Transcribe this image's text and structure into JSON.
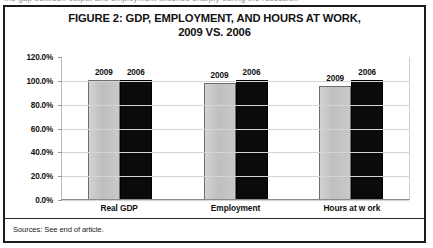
{
  "page": {
    "top_cut_text": "the gap between output and employment widened sharply during the recession"
  },
  "figure": {
    "title_line1": "FIGURE 2: GDP, EMPLOYMENT, AND HOURS AT WORK,",
    "title_line2": "2009 VS. 2006",
    "source_note": "Sources: See end of article."
  },
  "chart_data": {
    "type": "bar",
    "title": "FIGURE 2: GDP, EMPLOYMENT, AND HOURS AT WORK, 2009 VS. 2006",
    "xlabel": "",
    "ylabel": "",
    "ylim": [
      0,
      120
    ],
    "ytick_labels": [
      "120.0%",
      "100.0%",
      "80.0%",
      "60.0%",
      "40.0%",
      "20.0%",
      "0.0%"
    ],
    "ytick_values": [
      120,
      100,
      80,
      60,
      40,
      20,
      0
    ],
    "grid": true,
    "legend": "none",
    "data_labels_above_bars": true,
    "categories": [
      "Real GDP",
      "Employment",
      "Hours at w ork"
    ],
    "series": [
      {
        "name": "2009",
        "color": "#c6c6c6",
        "values": [
          100.0,
          97.5,
          94.5
        ]
      },
      {
        "name": "2006",
        "color": "#0b0b0b",
        "values": [
          100.0,
          100.0,
          100.0
        ]
      }
    ]
  }
}
